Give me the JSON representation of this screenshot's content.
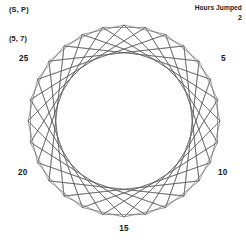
{
  "annotations": {
    "sp_label": "(S, P)",
    "pair_label": "(5, 7)",
    "hours_jumped_title": "Hours Jumped",
    "hours_jumped_value": "2"
  },
  "chart_data": {
    "type": "scatter",
    "title": "(S, P)",
    "subtitle": "(5, 7)",
    "xlabel": "",
    "ylabel": "",
    "grid": false,
    "legend_position": "none",
    "modulus": 28,
    "jump": 2,
    "start": 0,
    "line_color": "#595959",
    "line_width": 0.6,
    "center": [
      124,
      121
    ],
    "radius": 96,
    "start_angle_deg": -90,
    "direction": "clockwise",
    "categories": [
      "0",
      "1",
      "2",
      "3",
      "4",
      "5",
      "6",
      "7",
      "8",
      "9",
      "10",
      "11",
      "12",
      "13",
      "14",
      "15",
      "16",
      "17",
      "18",
      "19",
      "20",
      "21",
      "22",
      "23",
      "24",
      "25",
      "26",
      "27"
    ],
    "values": [
      0,
      2,
      4,
      6,
      8,
      10,
      12,
      14,
      16,
      18,
      20,
      22,
      24,
      26,
      0,
      2,
      4,
      6,
      8,
      10,
      12,
      14,
      16,
      18,
      20,
      22,
      24,
      26
    ],
    "tick_labels": [
      {
        "text": "5",
        "position": 5,
        "x": 221,
        "y": 54,
        "align": "left"
      },
      {
        "text": "10",
        "position": 10,
        "x": 218,
        "y": 168,
        "align": "left"
      },
      {
        "text": "15",
        "position": 15,
        "x": 116,
        "y": 224,
        "align": "center"
      },
      {
        "text": "20",
        "position": 20,
        "x": 18,
        "y": 168,
        "align": "left"
      },
      {
        "text": "25",
        "position": 25,
        "x": 19,
        "y": 54,
        "align": "left"
      }
    ],
    "annotations": [
      {
        "text": "(S, P)",
        "x": 9,
        "y": 6
      },
      {
        "text": "(5, 7)",
        "x": 9,
        "y": 35
      },
      {
        "text": "Hours Jumped",
        "x": 242,
        "y": 5
      },
      {
        "text": "2",
        "x": 242,
        "y": 14
      }
    ]
  }
}
